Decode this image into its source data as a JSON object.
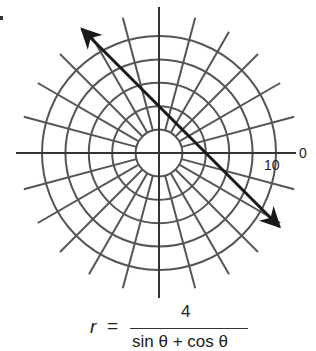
{
  "figure": {
    "type": "polar-graph",
    "center_px": [
      159,
      153
    ],
    "px_per_unit": 11.7,
    "rings": [
      2,
      4,
      6,
      8,
      10
    ],
    "spoke_step_deg": 15,
    "axis_labels": {
      "angle_zero": "0",
      "radius_ten": "10"
    },
    "line": {
      "description": "x + y = 4",
      "color": "#1a1a1a",
      "arrowheads": "both"
    },
    "grid_color": "#555555",
    "axis_color": "#333333"
  },
  "formula": {
    "lhs": "r",
    "eq": "=",
    "numerator": "4",
    "denominator": "sin θ + cos θ"
  }
}
